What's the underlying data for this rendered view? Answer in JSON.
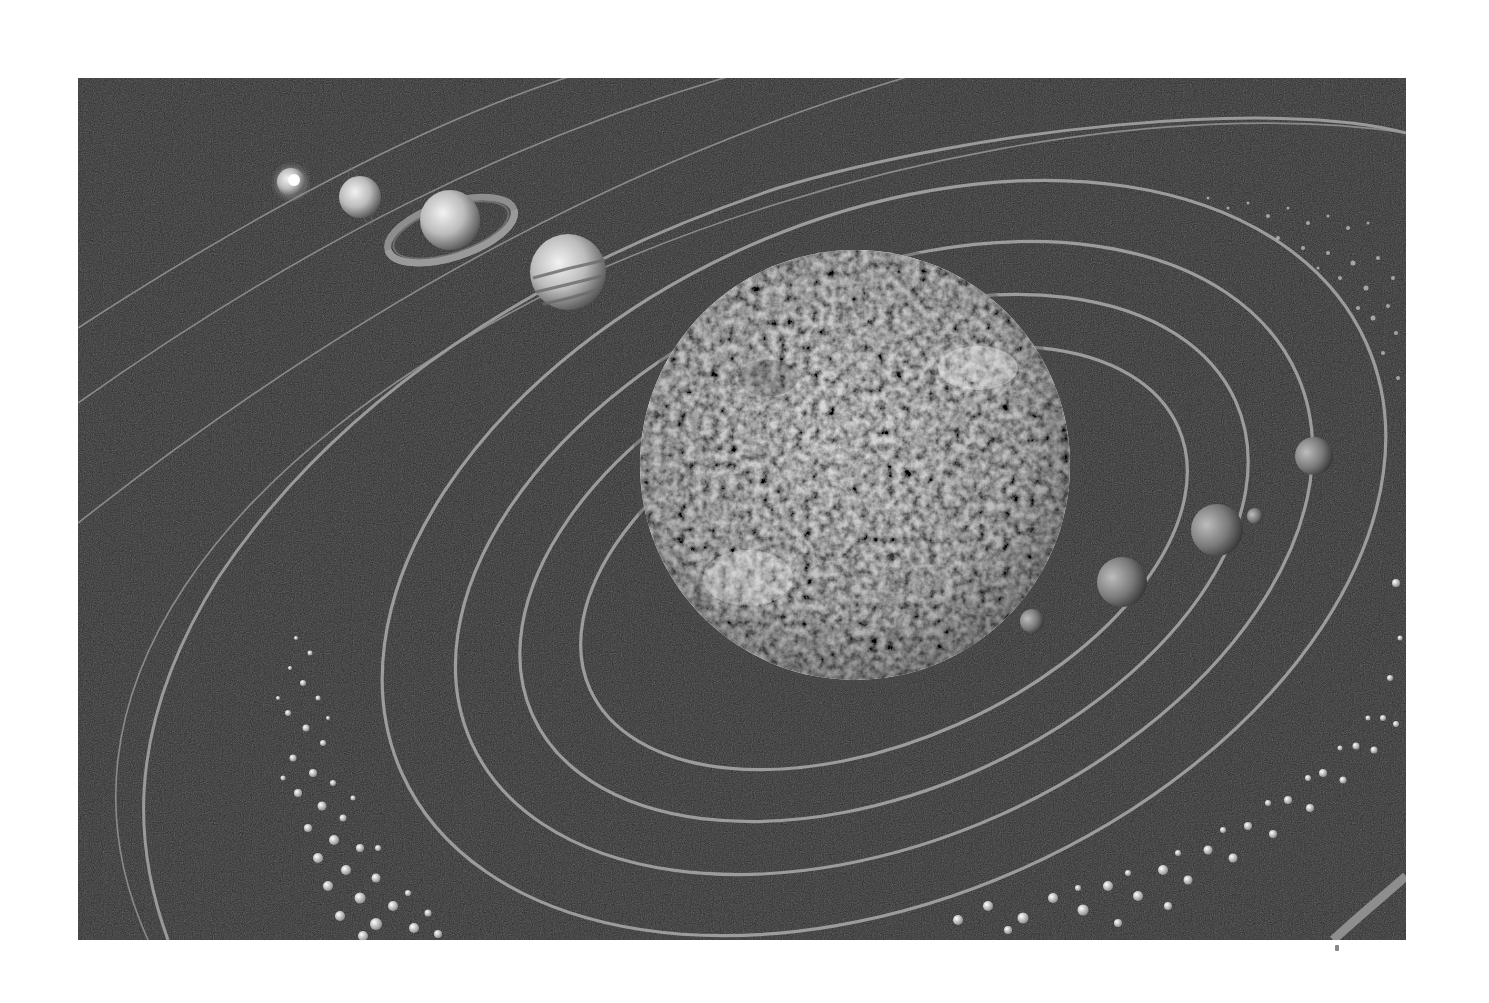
{
  "image": {
    "subject": "solar system illustration",
    "style": "grayscale",
    "colors": {
      "background_page": "#ffffff",
      "space": "#2a2a2a",
      "orbit_line": "#9a9a9a",
      "sun_light": "#e8e8e8",
      "sun_dark": "#6a6a6a"
    }
  },
  "bodies": [
    {
      "name": "sun",
      "cx": 777,
      "cy": 387,
      "r": 215
    },
    {
      "name": "mercury",
      "cx": 954,
      "cy": 543,
      "r": 12
    },
    {
      "name": "venus",
      "cx": 1044,
      "cy": 504,
      "r": 25
    },
    {
      "name": "earth",
      "cx": 1139,
      "cy": 452,
      "r": 26
    },
    {
      "name": "moon",
      "cx": 1177,
      "cy": 438,
      "r": 7
    },
    {
      "name": "mars",
      "cx": 1236,
      "cy": 378,
      "r": 18
    },
    {
      "name": "jupiter",
      "cx": 490,
      "cy": 194,
      "r": 38
    },
    {
      "name": "saturn",
      "cx": 372,
      "cy": 142,
      "r": 30
    },
    {
      "name": "uranus",
      "cx": 282,
      "cy": 119,
      "r": 21
    },
    {
      "name": "neptune",
      "cx": 213,
      "cy": 104,
      "r": 16
    }
  ]
}
